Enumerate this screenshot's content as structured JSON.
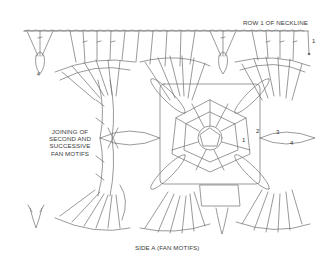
{
  "diagram": {
    "type": "crochet-chart",
    "stroke_color": "#6f6f6f",
    "background": "#ffffff",
    "labels": {
      "top_right": "ROW 1 OF NECKLINE",
      "left_lines": [
        "JOINING OF",
        "SECOND AND",
        "SUCCESSIVE",
        "FAN MOTIFS"
      ],
      "bottom": "SIDE A (FAN MOTIFS)"
    },
    "row_numbers": {
      "neckline_row": "1",
      "motif_round_1": "1",
      "motif_round_2": "2",
      "motif_round_3": "3",
      "motif_round_4": "4",
      "left_edge_round_4": "4"
    }
  }
}
